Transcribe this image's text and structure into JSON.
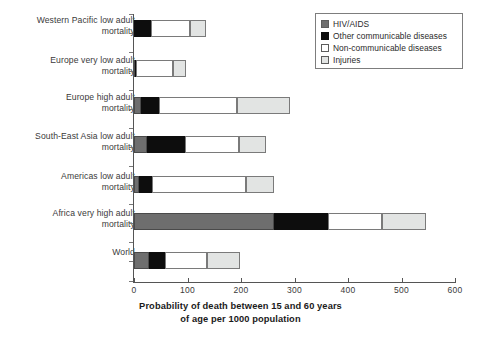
{
  "chart_data": {
    "type": "bar",
    "orientation": "horizontal",
    "stacked": true,
    "title": "",
    "xlabel_line1": "Probability of death between 15 and 60 years",
    "xlabel_line2": "of age per 1000 population",
    "ylabel": "",
    "xlim": [
      0,
      600
    ],
    "xticks": [
      0,
      100,
      200,
      300,
      400,
      500,
      600
    ],
    "xtick_labels": [
      "0",
      "100",
      "200",
      "300",
      "400",
      "500",
      "600"
    ],
    "grid": false,
    "legend_position": "top-right",
    "categories": [
      "Western Pacific low adult mortality",
      "Europe very low adult mortality",
      "Europe high adult mortality",
      "South-East Asia low adult mortality",
      "Americas low adult mortality",
      "Africa very high adult mortality",
      "World"
    ],
    "category_lines": [
      {
        "line1": "Western Pacific low adult",
        "line2": "mortality"
      },
      {
        "line1": "Europe very low adult",
        "line2": "mortality"
      },
      {
        "line1": "Europe high adult",
        "line2": "mortality"
      },
      {
        "line1": "South-East Asia low adult",
        "line2": "mortality"
      },
      {
        "line1": "Americas low adult",
        "line2": "mortality"
      },
      {
        "line1": "Africa very high adult",
        "line2": "mortality"
      },
      {
        "line1": "World",
        "line2": ""
      }
    ],
    "series": [
      {
        "name": "HIV/AIDS",
        "color": "#6e6e6e",
        "values": [
          0,
          1,
          13,
          24,
          9,
          262,
          28
        ]
      },
      {
        "name": "Other communicable diseases",
        "color": "#0d0d0d",
        "values": [
          31,
          3,
          33,
          71,
          25,
          100,
          30
        ]
      },
      {
        "name": "Non-communicable diseases",
        "color": "#ffffff",
        "values": [
          73,
          69,
          147,
          101,
          175,
          102,
          79
        ]
      },
      {
        "name": "Injuries",
        "color": "#e2e4e3",
        "values": [
          30,
          24,
          99,
          50,
          52,
          81,
          61
        ]
      }
    ],
    "totals": [
      134,
      97,
      292,
      246,
      261,
      545,
      198
    ]
  },
  "legend": {
    "items": [
      {
        "label": "HIV/AIDS",
        "swatch": "hiv"
      },
      {
        "label": "Other communicable diseases",
        "swatch": "othercomm"
      },
      {
        "label": "Non-communicable diseases",
        "swatch": "noncomm"
      },
      {
        "label": "Injuries",
        "swatch": "injuries"
      }
    ]
  }
}
